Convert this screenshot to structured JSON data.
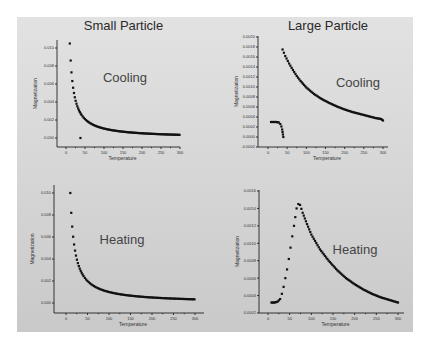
{
  "chart_data": [
    {
      "id": "small-cooling",
      "type": "scatter",
      "title": "Small Particle",
      "annotation": "Cooling",
      "xlabel": "Temperature",
      "ylabel": "Magnetization",
      "xlim": [
        -20,
        320
      ],
      "ylim": [
        -0.001,
        0.011
      ],
      "xticks": [
        0,
        50,
        100,
        150,
        200,
        250,
        300
      ],
      "yticks": [
        0.0,
        0.002,
        0.004,
        0.006,
        0.008,
        0.01
      ],
      "ytick_labels": [
        "0.000",
        "0.002",
        "0.004",
        "0.006",
        "0.008",
        "0.010"
      ],
      "series": [
        {
          "name": "Cooling",
          "model": "curie",
          "C": 0.105,
          "offset": 0.0,
          "x_from": 10,
          "x_to": 300,
          "extra_points": [
            [
              38,
              0.0
            ]
          ]
        }
      ]
    },
    {
      "id": "large-cooling",
      "type": "scatter",
      "title": "Large Particle",
      "annotation": "Cooling",
      "xlabel": "Temperature",
      "ylabel": "Magnetization",
      "xlim": [
        -20,
        320
      ],
      "ylim": [
        -0.0002,
        0.002
      ],
      "xticks": [
        0,
        50,
        100,
        150,
        200,
        250,
        300
      ],
      "yticks": [
        -0.0002,
        0.0,
        0.0002,
        0.0004,
        0.0006,
        0.0008,
        0.001,
        0.0012,
        0.0014,
        0.0016,
        0.0018,
        0.002
      ],
      "ytick_labels": [
        "-0.0002",
        "0.0000",
        "0.0002",
        "0.0004",
        "0.0006",
        "0.0008",
        "0.0010",
        "0.0012",
        "0.0014",
        "0.0016",
        "0.0018",
        "0.0020"
      ],
      "series": [
        {
          "name": "Cooling high-T",
          "points": [
            [
              38,
              0.00175
            ],
            [
              45,
              0.00162
            ],
            [
              55,
              0.00147
            ],
            [
              65,
              0.00134
            ],
            [
              75,
              0.00122
            ],
            [
              85,
              0.00112
            ],
            [
              100,
              0.00099
            ],
            [
              120,
              0.00086
            ],
            [
              140,
              0.00076
            ],
            [
              160,
              0.00068
            ],
            [
              180,
              0.00061
            ],
            [
              200,
              0.00055
            ],
            [
              220,
              0.0005
            ],
            [
              240,
              0.00046
            ],
            [
              260,
              0.00042
            ],
            [
              280,
              0.00038
            ],
            [
              295,
              0.00036
            ],
            [
              300,
              0.00033
            ]
          ]
        },
        {
          "name": "Cooling low-T",
          "points": [
            [
              8,
              0.0003
            ],
            [
              15,
              0.0003
            ],
            [
              22,
              0.0003
            ],
            [
              28,
              0.00029
            ],
            [
              32,
              0.00026
            ],
            [
              35,
              0.00021
            ],
            [
              37,
              0.00015
            ],
            [
              38,
              0.0001
            ],
            [
              39,
              5e-05
            ],
            [
              40,
              0.0
            ]
          ]
        }
      ]
    },
    {
      "id": "small-heating",
      "type": "scatter",
      "title": "",
      "annotation": "Heating",
      "xlabel": "Temperature",
      "ylabel": "Magnetization",
      "xlim": [
        -25,
        320
      ],
      "ylim": [
        -0.001,
        0.011
      ],
      "xticks": [
        0,
        50,
        100,
        150,
        200,
        250,
        300
      ],
      "yticks": [
        0.0,
        0.002,
        0.004,
        0.006,
        0.008,
        0.01
      ],
      "ytick_labels": [
        "0.000",
        "0.002",
        "0.004",
        "0.006",
        "0.008",
        "0.010"
      ],
      "series": [
        {
          "name": "Heating",
          "model": "curie",
          "C": 0.1,
          "offset": 0.0,
          "x_from": 10,
          "x_to": 300,
          "extra_points": []
        }
      ]
    },
    {
      "id": "large-heating",
      "type": "scatter",
      "title": "",
      "annotation": "Heating",
      "xlabel": "Temperature",
      "ylabel": "Magnetization",
      "xlim": [
        -25,
        320
      ],
      "ylim": [
        0.0002,
        0.0016
      ],
      "xticks": [
        0,
        50,
        100,
        150,
        200,
        250,
        300
      ],
      "yticks": [
        0.0002,
        0.0004,
        0.0006,
        0.0008,
        0.001,
        0.0012,
        0.0014,
        0.0016
      ],
      "ytick_labels": [
        "0.0002",
        "0.0004",
        "0.0006",
        "0.0008",
        "0.0010",
        "0.0012",
        "0.0014",
        "0.0016"
      ],
      "series": [
        {
          "name": "Heating",
          "points": [
            [
              8,
              0.00032
            ],
            [
              15,
              0.00032
            ],
            [
              22,
              0.00033
            ],
            [
              28,
              0.00036
            ],
            [
              32,
              0.00042
            ],
            [
              36,
              0.0005
            ],
            [
              40,
              0.0006
            ],
            [
              44,
              0.0007
            ],
            [
              48,
              0.00082
            ],
            [
              52,
              0.00095
            ],
            [
              56,
              0.00108
            ],
            [
              60,
              0.0012
            ],
            [
              63,
              0.0013
            ],
            [
              66,
              0.0014
            ],
            [
              70,
              0.00145
            ],
            [
              74,
              0.00144
            ],
            [
              80,
              0.00135
            ],
            [
              90,
              0.00122
            ],
            [
              100,
              0.0011
            ],
            [
              120,
              0.00093
            ],
            [
              140,
              0.0008
            ],
            [
              160,
              0.00069
            ],
            [
              180,
              0.0006
            ],
            [
              200,
              0.00053
            ],
            [
              220,
              0.00047
            ],
            [
              240,
              0.00042
            ],
            [
              260,
              0.00038
            ],
            [
              280,
              0.00035
            ],
            [
              300,
              0.00032
            ]
          ]
        }
      ]
    }
  ]
}
